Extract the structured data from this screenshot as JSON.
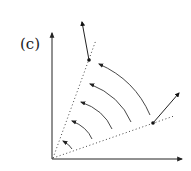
{
  "panel_label": "(c)",
  "colors": {
    "stroke": "#222222",
    "background": "#ffffff"
  },
  "diagram": {
    "origin": [
      52,
      159
    ],
    "x_axis_end": [
      184,
      159
    ],
    "y_axis_end": [
      52,
      31
    ],
    "dotted_rays": [
      {
        "from": [
          52,
          159
        ],
        "to": [
          96,
          40
        ]
      },
      {
        "from": [
          52,
          159
        ],
        "to": [
          174,
          116
        ]
      }
    ],
    "points": [
      {
        "name": "upper-point",
        "at": [
          89,
          60
        ],
        "vector_to": [
          81,
          17
        ]
      },
      {
        "name": "lower-point",
        "at": [
          153,
          123
        ],
        "vector_to": [
          182,
          90
        ]
      }
    ],
    "rotation_arcs": 5
  }
}
